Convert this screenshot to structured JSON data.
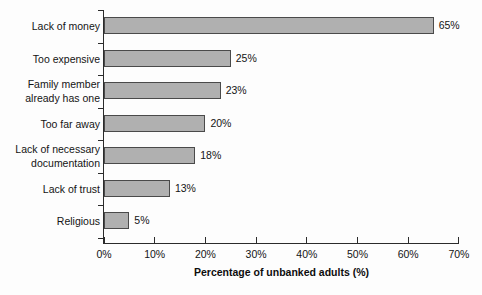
{
  "chart_data": {
    "type": "bar",
    "orientation": "horizontal",
    "title": "",
    "xlabel": "Percentage of unbanked adults (%)",
    "ylabel": "",
    "xlim": [
      0,
      70
    ],
    "xticks": [
      "0%",
      "10%",
      "20%",
      "30%",
      "40%",
      "50%",
      "60%",
      "70%"
    ],
    "xtick_values": [
      0,
      10,
      20,
      30,
      40,
      50,
      60,
      70
    ],
    "grid": false,
    "legend": false,
    "categories": [
      "Lack of money",
      "Too expensive",
      "Family member\nalready has one",
      "Too far away",
      "Lack of necessary\ndocumentation",
      "Lack of trust",
      "Religious"
    ],
    "values": [
      65,
      25,
      23,
      20,
      18,
      13,
      5
    ],
    "data_labels": [
      "65%",
      "25%",
      "23%",
      "20%",
      "18%",
      "13%",
      "5%"
    ],
    "bar_color": "#b0b0b0",
    "bar_edge_color": "#4a4a4a",
    "background_color": "#fdfdfd",
    "axis_color": "#2b2b2b"
  }
}
